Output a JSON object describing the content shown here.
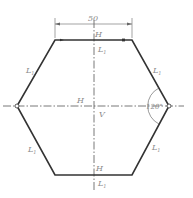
{
  "diagram": {
    "type": "regular-hexagon",
    "dimension": {
      "value": "50"
    },
    "angle": {
      "value": "120°"
    },
    "labels": {
      "top_H": "H",
      "top_L": "L",
      "top_L_sub": "1",
      "upper_left_L": "L",
      "upper_left_L_sub": "1",
      "upper_right_L": "L",
      "upper_right_L_sub": "1",
      "center_H": "H",
      "center_V": "V",
      "lower_left_L": "L",
      "lower_left_L_sub": "1",
      "lower_right_L": "L",
      "lower_right_L_sub": "1",
      "bottom_H": "H",
      "bottom_L": "L",
      "bottom_L_sub": "1"
    },
    "colors": {
      "outline": "#333333",
      "center_line": "#555555",
      "dimension": "#666666",
      "label": "#8a8a8a"
    }
  }
}
